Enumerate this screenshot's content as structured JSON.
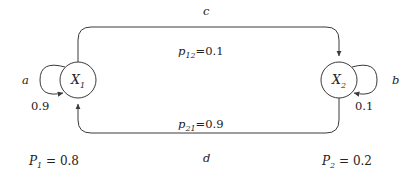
{
  "diagram": {
    "type": "markov-chain-state-diagram",
    "stroke_color": "#3a3a3a",
    "text_color": "#222222",
    "background_color": "#ffffff",
    "nodes": [
      {
        "id": "x1",
        "label": "X",
        "subscript": "1",
        "cx": 78,
        "cy": 80,
        "r": 18
      },
      {
        "id": "x2",
        "label": "X",
        "subscript": "2",
        "cx": 339,
        "cy": 80,
        "r": 18
      }
    ],
    "edge_letters": {
      "left": "a",
      "right": "b",
      "top": "c",
      "bottom": "d"
    },
    "self_loops": [
      {
        "id": "loop-x1",
        "node": "x1",
        "weight": "0.9",
        "side": "left"
      },
      {
        "id": "loop-x2",
        "node": "x2",
        "weight": "0.1",
        "side": "right"
      }
    ],
    "transitions": [
      {
        "id": "x1-to-x2",
        "from": "x1",
        "to": "x2",
        "symbol": "p",
        "subscript": "12",
        "equals": "=",
        "value": "0.1",
        "text": "p12=0.1",
        "position": "top"
      },
      {
        "id": "x2-to-x1",
        "from": "x2",
        "to": "x1",
        "symbol": "p",
        "subscript": "21",
        "equals": "=",
        "value": "0.9",
        "text": "p21=0.9",
        "position": "bottom"
      }
    ],
    "state_probabilities": [
      {
        "id": "p1",
        "symbol": "P",
        "subscript": "1",
        "equals": "=",
        "value": "0.8",
        "text": "P1 = 0.8"
      },
      {
        "id": "p2",
        "symbol": "P",
        "subscript": "2",
        "equals": "=",
        "value": "0.2",
        "text": "P2 = 0.2"
      }
    ]
  }
}
